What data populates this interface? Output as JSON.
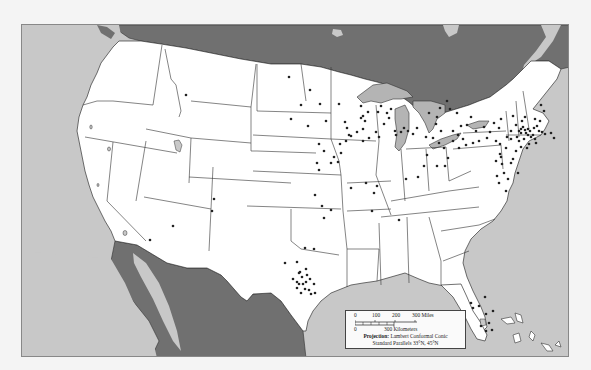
{
  "map": {
    "colors": {
      "ocean": "#c8c8c8",
      "foreign_land": "#707070",
      "us_land": "#ffffff",
      "lakes": "#b4b4b4",
      "borders": "#333333",
      "dots": "#222222",
      "page_bg": "#f4f4f4"
    },
    "legend": {
      "miles_ticks": [
        "0",
        "100",
        "200",
        "300 Miles"
      ],
      "km_ticks": [
        "0",
        "300 Kilometers"
      ],
      "projection_label": "Projection:",
      "projection_value": "Lambert Conformal Conic",
      "parallels": "Standard Parallels 33°N, 45°N"
    },
    "dots": [
      [
        185,
        94
      ],
      [
        288,
        76
      ],
      [
        309,
        89
      ],
      [
        300,
        104
      ],
      [
        319,
        103
      ],
      [
        290,
        118
      ],
      [
        307,
        125
      ],
      [
        325,
        120
      ],
      [
        338,
        103
      ],
      [
        344,
        121
      ],
      [
        323,
        150
      ],
      [
        333,
        156
      ],
      [
        318,
        143
      ],
      [
        316,
        162
      ],
      [
        318,
        169
      ],
      [
        330,
        162
      ],
      [
        337,
        161
      ],
      [
        340,
        152
      ],
      [
        339,
        143
      ],
      [
        345,
        140
      ],
      [
        350,
        135
      ],
      [
        346,
        127
      ],
      [
        362,
        140
      ],
      [
        362,
        128
      ],
      [
        348,
        134
      ],
      [
        356,
        131
      ],
      [
        375,
        131
      ],
      [
        383,
        123
      ],
      [
        378,
        136
      ],
      [
        368,
        137
      ],
      [
        360,
        117
      ],
      [
        362,
        115
      ],
      [
        360,
        105
      ],
      [
        367,
        111
      ],
      [
        364,
        120
      ],
      [
        386,
        112
      ],
      [
        388,
        117
      ],
      [
        390,
        108
      ],
      [
        377,
        111
      ],
      [
        380,
        105
      ],
      [
        394,
        130
      ],
      [
        400,
        131
      ],
      [
        403,
        127
      ],
      [
        395,
        134
      ],
      [
        407,
        130
      ],
      [
        412,
        133
      ],
      [
        416,
        127
      ],
      [
        425,
        136
      ],
      [
        432,
        137
      ],
      [
        438,
        142
      ],
      [
        443,
        147
      ],
      [
        426,
        154
      ],
      [
        447,
        157
      ],
      [
        444,
        165
      ],
      [
        436,
        165
      ],
      [
        423,
        165
      ],
      [
        376,
        185
      ],
      [
        373,
        192
      ],
      [
        365,
        182
      ],
      [
        350,
        187
      ],
      [
        405,
        178
      ],
      [
        314,
        194
      ],
      [
        371,
        210
      ],
      [
        398,
        219
      ],
      [
        417,
        176
      ],
      [
        475,
        130
      ],
      [
        483,
        126
      ],
      [
        493,
        122
      ],
      [
        500,
        118
      ],
      [
        498,
        127
      ],
      [
        510,
        130
      ],
      [
        495,
        140
      ],
      [
        499,
        143
      ],
      [
        505,
        147
      ],
      [
        520,
        146
      ],
      [
        515,
        150
      ],
      [
        499,
        153
      ],
      [
        500,
        156
      ],
      [
        495,
        160
      ],
      [
        501,
        163
      ],
      [
        510,
        162
      ],
      [
        496,
        175
      ],
      [
        498,
        182
      ],
      [
        507,
        178
      ],
      [
        503,
        172
      ],
      [
        505,
        190
      ],
      [
        517,
        172
      ],
      [
        512,
        158
      ],
      [
        520,
        132
      ],
      [
        518,
        130
      ],
      [
        520,
        128
      ],
      [
        522,
        126
      ],
      [
        524,
        129
      ],
      [
        525,
        132
      ],
      [
        527,
        128
      ],
      [
        529,
        130
      ],
      [
        527,
        134
      ],
      [
        530,
        136
      ],
      [
        532,
        134
      ],
      [
        534,
        138
      ],
      [
        523,
        138
      ],
      [
        518,
        140
      ],
      [
        516,
        136
      ],
      [
        510,
        138
      ],
      [
        506,
        136
      ],
      [
        533,
        127
      ],
      [
        536,
        125
      ],
      [
        538,
        130
      ],
      [
        541,
        131
      ],
      [
        544,
        133
      ],
      [
        535,
        142
      ],
      [
        528,
        143
      ],
      [
        526,
        147
      ],
      [
        534,
        118
      ],
      [
        539,
        120
      ],
      [
        543,
        110
      ],
      [
        540,
        104
      ],
      [
        550,
        132
      ],
      [
        553,
        137
      ],
      [
        515,
        124
      ],
      [
        512,
        115
      ],
      [
        521,
        120
      ],
      [
        524,
        116
      ],
      [
        489,
        131
      ],
      [
        486,
        137
      ],
      [
        478,
        140
      ],
      [
        472,
        142
      ],
      [
        465,
        144
      ],
      [
        458,
        147
      ],
      [
        452,
        140
      ],
      [
        462,
        138
      ],
      [
        457,
        134
      ],
      [
        466,
        124
      ],
      [
        470,
        116
      ],
      [
        439,
        107
      ],
      [
        436,
        116
      ],
      [
        446,
        100
      ],
      [
        449,
        108
      ],
      [
        456,
        112
      ],
      [
        428,
        112
      ],
      [
        435,
        123
      ],
      [
        440,
        130
      ],
      [
        452,
        130
      ],
      [
        460,
        125
      ],
      [
        321,
        205
      ],
      [
        330,
        209
      ],
      [
        323,
        217
      ],
      [
        304,
        247
      ],
      [
        313,
        248
      ],
      [
        284,
        262
      ],
      [
        296,
        261
      ],
      [
        299,
        271
      ],
      [
        292,
        278
      ],
      [
        296,
        281
      ],
      [
        298,
        283
      ],
      [
        302,
        283
      ],
      [
        305,
        281
      ],
      [
        306,
        274
      ],
      [
        301,
        276
      ],
      [
        298,
        272
      ],
      [
        304,
        288
      ],
      [
        308,
        289
      ],
      [
        296,
        287
      ],
      [
        300,
        292
      ],
      [
        309,
        278
      ],
      [
        314,
        292
      ],
      [
        310,
        293
      ],
      [
        313,
        283
      ],
      [
        305,
        268
      ],
      [
        470,
        302
      ],
      [
        472,
        307
      ],
      [
        478,
        305
      ],
      [
        484,
        296
      ],
      [
        485,
        313
      ],
      [
        488,
        322
      ],
      [
        491,
        329
      ],
      [
        492,
        310
      ],
      [
        485,
        330
      ],
      [
        480,
        325
      ],
      [
        149,
        239
      ],
      [
        213,
        198
      ],
      [
        211,
        210
      ],
      [
        172,
        225
      ]
    ]
  }
}
